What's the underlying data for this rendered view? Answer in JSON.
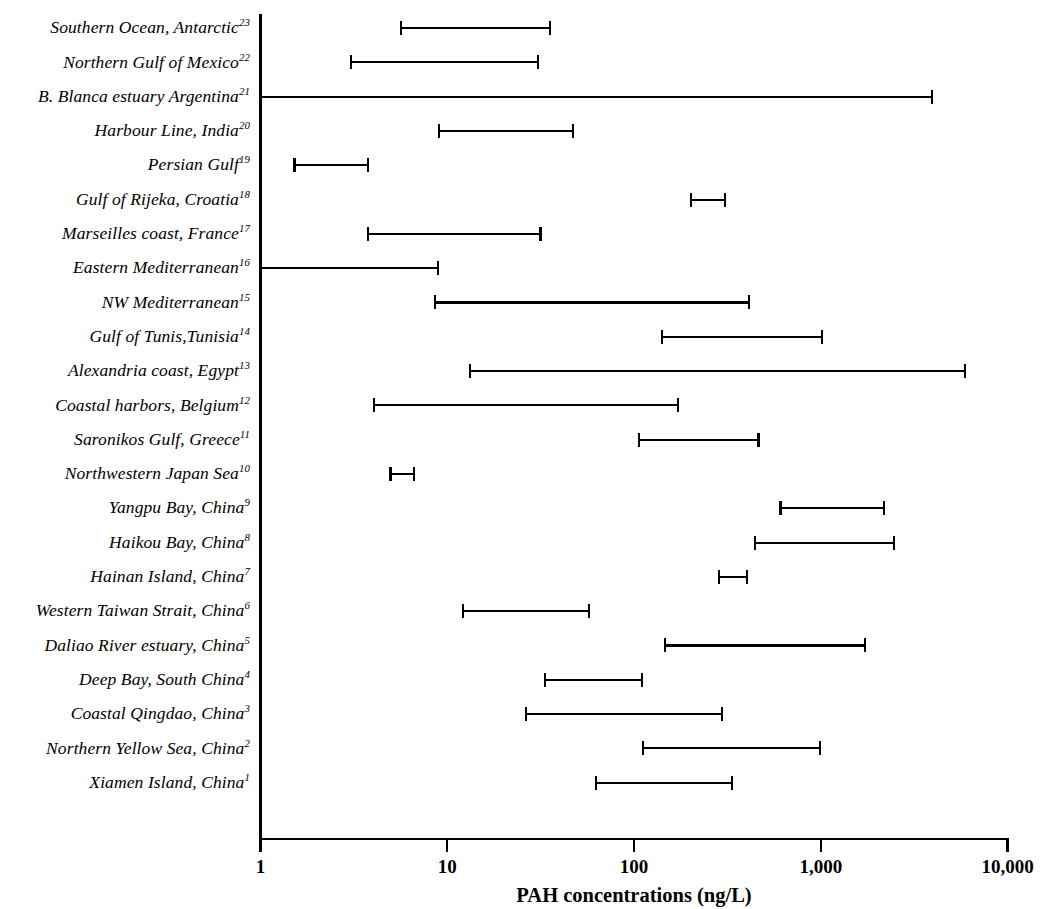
{
  "chart_data": {
    "type": "bar",
    "subtype": "horizontal-range",
    "title": "",
    "xlabel": "PAH concentrations (ng/L)",
    "ylabel": "",
    "xscale": "log",
    "xlim": [
      1,
      10000
    ],
    "xticks": [
      1,
      10,
      100,
      1000,
      10000
    ],
    "xticklabels": [
      "1",
      "10",
      "100",
      "1,000",
      "10,000"
    ],
    "grid": false,
    "legend": false,
    "units": "ng/L",
    "categories": [
      "Southern Ocean, Antarctic",
      "Northern Gulf of Mexico",
      "B. Blanca estuary Argentina",
      "Harbour Line, India",
      "Persian Gulf",
      "Gulf of Rijeka, Croatia",
      "Marseilles coast, France",
      "Eastern Mediterranean",
      "NW Mediterranean",
      "Gulf of Tunis,Tunisia",
      "Alexandria coast, Egypt",
      "Coastal harbors, Belgium",
      "Saronikos Gulf, Greece",
      "Northwestern Japan Sea",
      "Yangpu Bay, China",
      "Haikou Bay, China",
      "Hainan Island, China",
      "Western Taiwan Strait, China",
      "Daliao River estuary, China",
      "Deep Bay, South China",
      "Coastal Qingdao, China",
      "Northern Yellow Sea, China",
      "Xiamen Island, China"
    ],
    "references": [
      "23",
      "22",
      "21",
      "20",
      "19",
      "18",
      "17",
      "16",
      "15",
      "14",
      "13",
      "12",
      "11",
      "10",
      "9",
      "8",
      "7",
      "6",
      "5",
      "4",
      "3",
      "2",
      "1"
    ],
    "rows": [
      {
        "label": "Southern Ocean, Antarctic",
        "ref": "23",
        "min": 5.6,
        "max": 36,
        "open_left": false
      },
      {
        "label": "Northern Gulf of Mexico",
        "ref": "22",
        "min": 3.0,
        "max": 31,
        "open_left": false
      },
      {
        "label": "B. Blanca estuary Argentina",
        "ref": "21",
        "min": 1.0,
        "max": 4000,
        "open_left": true
      },
      {
        "label": "Harbour Line, India",
        "ref": "20",
        "min": 8.9,
        "max": 48,
        "open_left": false
      },
      {
        "label": "Persian Gulf",
        "ref": "19",
        "min": 1.5,
        "max": 3.8,
        "open_left": false
      },
      {
        "label": "Gulf of Rijeka, Croatia",
        "ref": "18",
        "min": 200,
        "max": 310,
        "open_left": false
      },
      {
        "label": "Marseilles coast, France",
        "ref": "17",
        "min": 3.7,
        "max": 32,
        "open_left": false
      },
      {
        "label": "Eastern Mediterranean",
        "ref": "16",
        "min": 1.0,
        "max": 9.0,
        "open_left": true
      },
      {
        "label": "NW Mediterranean",
        "ref": "15",
        "min": 8.5,
        "max": 420,
        "open_left": false
      },
      {
        "label": "Gulf of Tunis,Tunisia",
        "ref": "14",
        "min": 140,
        "max": 1030,
        "open_left": false
      },
      {
        "label": "Alexandria coast, Egypt",
        "ref": "13",
        "min": 13,
        "max": 6000,
        "open_left": false
      },
      {
        "label": "Coastal harbors, Belgium",
        "ref": "12",
        "min": 4.0,
        "max": 175,
        "open_left": false
      },
      {
        "label": "Saronikos Gulf, Greece",
        "ref": "11",
        "min": 105,
        "max": 470,
        "open_left": false
      },
      {
        "label": "Northwestern Japan Sea",
        "ref": "10",
        "min": 4.9,
        "max": 6.7,
        "open_left": false
      },
      {
        "label": "Yangpu Bay, China",
        "ref": "9",
        "min": 600,
        "max": 2200,
        "open_left": false
      },
      {
        "label": "Haikou Bay, China",
        "ref": "8",
        "min": 440,
        "max": 2500,
        "open_left": false
      },
      {
        "label": "Hainan Island, China",
        "ref": "7",
        "min": 280,
        "max": 410,
        "open_left": false
      },
      {
        "label": "Western Taiwan Strait, China",
        "ref": "6",
        "min": 12,
        "max": 58,
        "open_left": false
      },
      {
        "label": "Daliao River estuary, China",
        "ref": "5",
        "min": 145,
        "max": 1750,
        "open_left": false
      },
      {
        "label": "Deep Bay, South China",
        "ref": "4",
        "min": 33,
        "max": 112,
        "open_left": false
      },
      {
        "label": "Coastal Qingdao, China",
        "ref": "3",
        "min": 26,
        "max": 300,
        "open_left": false
      },
      {
        "label": "Northern Yellow Sea, China",
        "ref": "2",
        "min": 110,
        "max": 1000,
        "open_left": false
      },
      {
        "label": "Xiamen Island, China",
        "ref": "1",
        "min": 62,
        "max": 340,
        "open_left": false
      }
    ]
  },
  "colors": {
    "ink": "#000000",
    "background": "#ffffff"
  }
}
